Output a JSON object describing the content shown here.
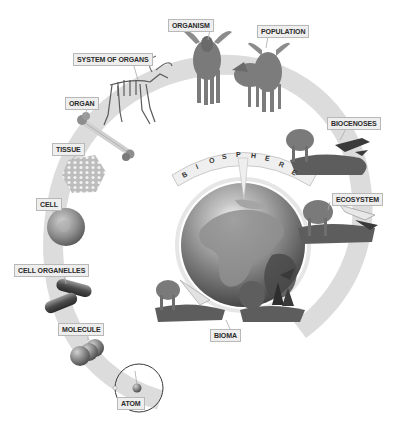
{
  "diagram": {
    "title_letters": [
      "B",
      "I",
      "O",
      "S",
      "P",
      "H",
      "E",
      "R",
      "E"
    ],
    "levels": [
      {
        "id": "atom",
        "label": "ATOM"
      },
      {
        "id": "molecule",
        "label": "MOLECULE"
      },
      {
        "id": "cell-organelles",
        "label": "CELL ORGANELLES"
      },
      {
        "id": "cell",
        "label": "CELL"
      },
      {
        "id": "tissue",
        "label": "TISSUE"
      },
      {
        "id": "organ",
        "label": "ORGAN"
      },
      {
        "id": "system-of-organs",
        "label": "SYSTEM OF ORGANS"
      },
      {
        "id": "organism",
        "label": "ORGANISM"
      },
      {
        "id": "population",
        "label": "POPULATION"
      },
      {
        "id": "biocenoses",
        "label": "BIOCENOSES"
      },
      {
        "id": "ecosystem",
        "label": "ECOSYSTEM"
      },
      {
        "id": "bioma",
        "label": "BIOMA"
      }
    ],
    "colors": {
      "ring": "#dcdcdc",
      "label_bg": "#eeeeee",
      "label_border": "#b8b8b8",
      "label_text": "#2a2a2a",
      "globe_land": "#8a8a8a",
      "globe_ocean": "#5a5a5a"
    }
  }
}
